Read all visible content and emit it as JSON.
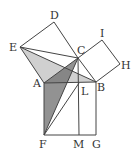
{
  "diagram": {
    "title": "",
    "points": {
      "A": [
        44,
        83
      ],
      "B": [
        96,
        82
      ],
      "C": [
        78,
        58
      ],
      "D": [
        54,
        22
      ],
      "E": [
        20,
        47
      ],
      "F": [
        44,
        135
      ],
      "G": [
        96,
        135
      ],
      "H": [
        120,
        64
      ],
      "I": [
        102,
        40
      ],
      "L": [
        79,
        83
      ],
      "M": [
        79,
        135
      ]
    },
    "labels": [
      {
        "id": "D",
        "text": "D",
        "x": 50,
        "y": 19
      },
      {
        "id": "E",
        "text": "E",
        "x": 9,
        "y": 51
      },
      {
        "id": "C",
        "text": "C",
        "x": 77,
        "y": 54
      },
      {
        "id": "I",
        "text": "I",
        "x": 100,
        "y": 37
      },
      {
        "id": "H",
        "text": "H",
        "x": 121,
        "y": 69
      },
      {
        "id": "A",
        "text": "A",
        "x": 33,
        "y": 87
      },
      {
        "id": "L",
        "text": "L",
        "x": 81,
        "y": 95
      },
      {
        "id": "B",
        "text": "B",
        "x": 97,
        "y": 91
      },
      {
        "id": "F",
        "text": "F",
        "x": 39,
        "y": 148
      },
      {
        "id": "M",
        "text": "M",
        "x": 73,
        "y": 148
      },
      {
        "id": "G",
        "text": "G",
        "x": 92,
        "y": 148
      }
    ],
    "shaded": [
      {
        "name": "triangle-EAB",
        "fill": "#c8c8c8"
      },
      {
        "name": "triangle-ACF",
        "fill": "#8a8a8a"
      }
    ],
    "stroke": "#444444"
  }
}
